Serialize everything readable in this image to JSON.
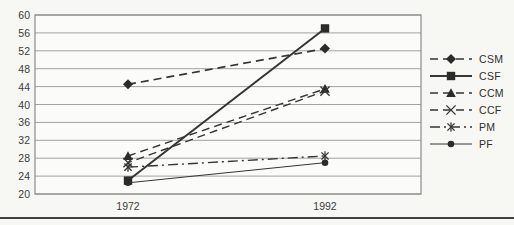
{
  "chart_data": {
    "type": "line",
    "title": "",
    "categories": [
      "1972",
      "1992"
    ],
    "ylim": [
      20,
      60
    ],
    "ytick_step": 4,
    "yticks": [
      20,
      24,
      28,
      32,
      36,
      40,
      44,
      48,
      52,
      56,
      60
    ],
    "grid": true,
    "legend_position": "right",
    "series": [
      {
        "name": "CSM",
        "values": [
          44.5,
          52.5
        ],
        "marker": "diamond",
        "dash": "dashed",
        "width": 1.7
      },
      {
        "name": "CSF",
        "values": [
          23.0,
          57.0
        ],
        "marker": "square",
        "dash": "solid",
        "width": 2.0
      },
      {
        "name": "CCM",
        "values": [
          28.5,
          43.5
        ],
        "marker": "triangle",
        "dash": "dashed",
        "width": 1.4
      },
      {
        "name": "CCF",
        "values": [
          27.0,
          43.0
        ],
        "marker": "x",
        "dash": "dashed",
        "width": 1.4
      },
      {
        "name": "PM",
        "values": [
          26.0,
          28.5
        ],
        "marker": "asterisk",
        "dash": "dashdot",
        "width": 1.4
      },
      {
        "name": "PF",
        "values": [
          22.5,
          27.0
        ],
        "marker": "circle",
        "dash": "solid",
        "width": 1.0
      }
    ],
    "colors": {
      "line": "#353535",
      "marker_fill": "#2b2b2b",
      "grid": "#a2a2a2",
      "axis_box": "#8c8c8c",
      "plot_fill": "#fbfbf9",
      "tick_label": "#3d3d3d"
    }
  }
}
